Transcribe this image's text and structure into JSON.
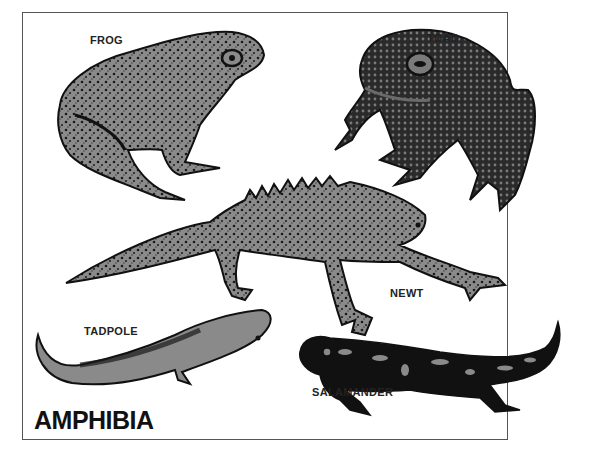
{
  "plate": {
    "title": "AMPHIBIA",
    "colors": {
      "fill": "#8a8a8a",
      "ink": "#1a1a1a",
      "border": "#555555",
      "background": "#ffffff"
    },
    "animals": [
      {
        "id": "frog",
        "label": "FROG"
      },
      {
        "id": "toad",
        "label": "TOAD"
      },
      {
        "id": "newt",
        "label": "NEWT"
      },
      {
        "id": "tadpole",
        "label": "TADPOLE"
      },
      {
        "id": "salamander",
        "label": "SALAMANDER"
      }
    ]
  }
}
